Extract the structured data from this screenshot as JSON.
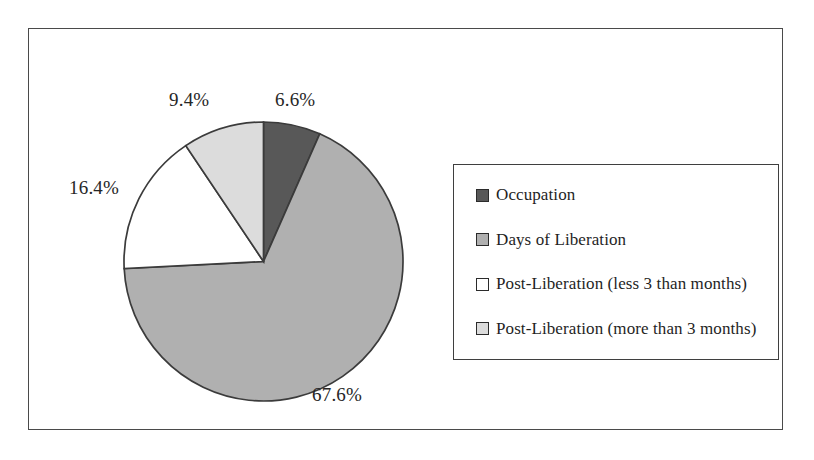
{
  "chart_data": {
    "type": "pie",
    "title": "",
    "subtitle": "",
    "legend_position": "right",
    "grid": false,
    "start_angle_deg": 0,
    "direction": "clockwise",
    "categories": [
      "Occupation",
      "Days of Liberation",
      "Post-Liberation (less 3 than months)",
      "Post-Liberation (more than 3 months)"
    ],
    "values": [
      6.6,
      67.6,
      16.4,
      9.4
    ],
    "value_labels": [
      "6.6%",
      "67.6%",
      "16.4%",
      "9.4%"
    ],
    "colors": [
      "#585858",
      "#b0b0b0",
      "#ffffff",
      "#dcdcdc"
    ],
    "slice_order_clockwise_from_top": [
      "Occupation",
      "Days of Liberation",
      "Post-Liberation (less 3 than months)",
      "Post-Liberation (more than 3 months)"
    ],
    "units": "percent",
    "xlabel": "",
    "ylabel": ""
  },
  "labels": {
    "occupation_pct": "6.6%",
    "days_pct": "67.6%",
    "post_less_pct": "16.4%",
    "post_more_pct": "9.4%"
  },
  "legend": {
    "items": [
      {
        "label": "Occupation",
        "swatch_color": "#585858"
      },
      {
        "label": "Days of Liberation",
        "swatch_color": "#b0b0b0"
      },
      {
        "label": "Post-Liberation (less 3 than months)",
        "swatch_color": "#ffffff"
      },
      {
        "label": "Post-Liberation (more than 3 months)",
        "swatch_color": "#dcdcdc"
      }
    ]
  },
  "style": {
    "frame_border_color": "#4a4a4a",
    "slice_outline_color": "#3b3b3b",
    "background": "#ffffff"
  }
}
